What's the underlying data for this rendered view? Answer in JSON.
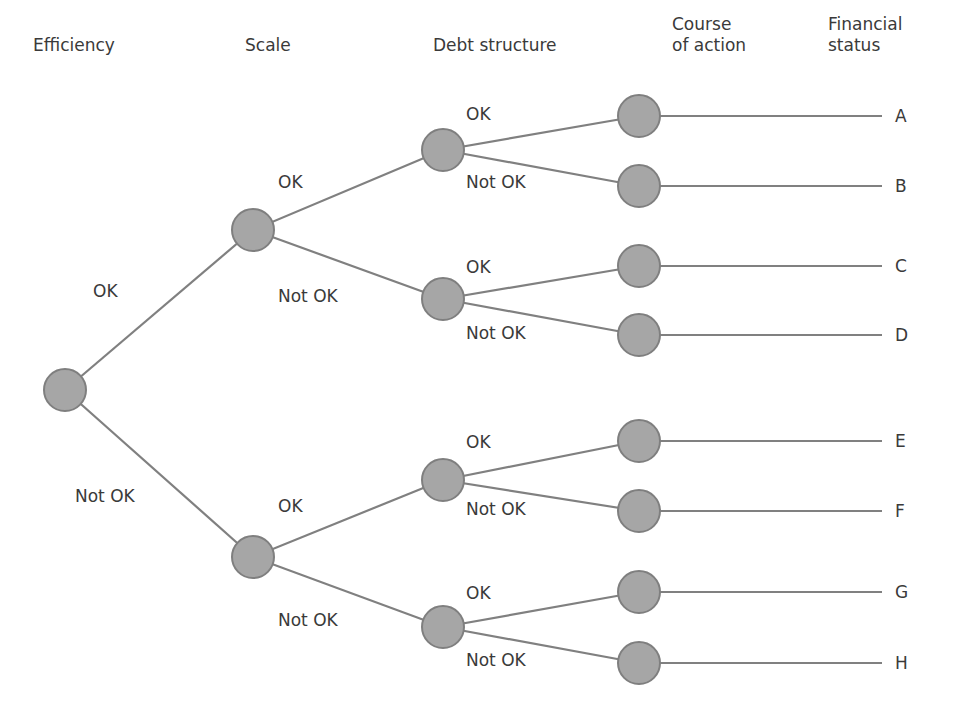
{
  "diagram": {
    "type": "decision-tree",
    "colors": {
      "node_fill": "#a6a6a6",
      "node_stroke": "#7f7f7f",
      "edge": "#808080",
      "text": "#3a3a3a",
      "background": "#ffffff"
    },
    "headers": [
      {
        "id": "efficiency",
        "text": "Efficiency",
        "x": 33,
        "y": 35
      },
      {
        "id": "scale",
        "text": "Scale",
        "x": 245,
        "y": 35
      },
      {
        "id": "debt",
        "text": "Debt structure",
        "x": 433,
        "y": 35
      },
      {
        "id": "action",
        "text": "Course\nof action",
        "x": 672,
        "y": 14
      },
      {
        "id": "status",
        "text": "Financial\nstatus",
        "x": 828,
        "y": 14
      }
    ],
    "nodes": [
      {
        "id": "root",
        "level": "efficiency",
        "x": 65,
        "y": 390
      },
      {
        "id": "s1",
        "level": "scale",
        "x": 253,
        "y": 230
      },
      {
        "id": "s2",
        "level": "scale",
        "x": 253,
        "y": 557
      },
      {
        "id": "d1",
        "level": "debt",
        "x": 443,
        "y": 150
      },
      {
        "id": "d2",
        "level": "debt",
        "x": 443,
        "y": 299
      },
      {
        "id": "d3",
        "level": "debt",
        "x": 443,
        "y": 480
      },
      {
        "id": "d4",
        "level": "debt",
        "x": 443,
        "y": 627
      },
      {
        "id": "a1",
        "level": "action",
        "x": 639,
        "y": 116
      },
      {
        "id": "a2",
        "level": "action",
        "x": 639,
        "y": 186
      },
      {
        "id": "a3",
        "level": "action",
        "x": 639,
        "y": 266
      },
      {
        "id": "a4",
        "level": "action",
        "x": 639,
        "y": 335
      },
      {
        "id": "a5",
        "level": "action",
        "x": 639,
        "y": 441
      },
      {
        "id": "a6",
        "level": "action",
        "x": 639,
        "y": 511
      },
      {
        "id": "a7",
        "level": "action",
        "x": 639,
        "y": 592
      },
      {
        "id": "a8",
        "level": "action",
        "x": 639,
        "y": 663
      }
    ],
    "node_radius": 21,
    "edges": [
      {
        "from": "root",
        "to": "s1",
        "label": "OK",
        "lx": 93,
        "ly": 281
      },
      {
        "from": "root",
        "to": "s2",
        "label": "Not OK",
        "lx": 75,
        "ly": 486
      },
      {
        "from": "s1",
        "to": "d1",
        "label": "OK",
        "lx": 278,
        "ly": 172
      },
      {
        "from": "s1",
        "to": "d2",
        "label": "Not OK",
        "lx": 278,
        "ly": 286
      },
      {
        "from": "s2",
        "to": "d3",
        "label": "OK",
        "lx": 278,
        "ly": 496
      },
      {
        "from": "s2",
        "to": "d4",
        "label": "Not OK",
        "lx": 278,
        "ly": 610
      },
      {
        "from": "d1",
        "to": "a1",
        "label": "OK",
        "lx": 466,
        "ly": 104
      },
      {
        "from": "d1",
        "to": "a2",
        "label": "Not OK",
        "lx": 466,
        "ly": 172
      },
      {
        "from": "d2",
        "to": "a3",
        "label": "OK",
        "lx": 466,
        "ly": 257
      },
      {
        "from": "d2",
        "to": "a4",
        "label": "Not OK",
        "lx": 466,
        "ly": 323
      },
      {
        "from": "d3",
        "to": "a5",
        "label": "OK",
        "lx": 466,
        "ly": 432
      },
      {
        "from": "d3",
        "to": "a6",
        "label": "Not OK",
        "lx": 466,
        "ly": 499
      },
      {
        "from": "d4",
        "to": "a7",
        "label": "OK",
        "lx": 466,
        "ly": 583
      },
      {
        "from": "d4",
        "to": "a8",
        "label": "Not OK",
        "lx": 466,
        "ly": 650
      }
    ],
    "outcomes": [
      {
        "from": "a1",
        "label": "A",
        "x": 895,
        "y": 116
      },
      {
        "from": "a2",
        "label": "B",
        "x": 895,
        "y": 186
      },
      {
        "from": "a3",
        "label": "C",
        "x": 895,
        "y": 266
      },
      {
        "from": "a4",
        "label": "D",
        "x": 895,
        "y": 335
      },
      {
        "from": "a5",
        "label": "E",
        "x": 895,
        "y": 441
      },
      {
        "from": "a6",
        "label": "F",
        "x": 895,
        "y": 511
      },
      {
        "from": "a7",
        "label": "G",
        "x": 895,
        "y": 592
      },
      {
        "from": "a8",
        "label": "H",
        "x": 895,
        "y": 663
      }
    ],
    "outcome_line_end_x": 882
  }
}
